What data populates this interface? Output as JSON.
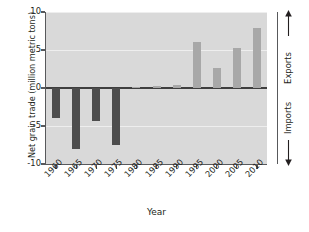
{
  "chart_data": {
    "type": "bar",
    "title": "",
    "subtitle": "",
    "xlabel": "Year",
    "ylabel": "Net grain trade (million metric tons)",
    "categories": [
      "1960",
      "1965",
      "1970",
      "1975",
      "1980",
      "1985",
      "1990",
      "1995",
      "2000",
      "2005",
      "2010"
    ],
    "values": [
      -4.0,
      -8.0,
      -4.4,
      -7.5,
      0.15,
      0.3,
      0.4,
      6.1,
      2.6,
      5.2,
      7.9
    ],
    "series": [
      {
        "name": "Net grain trade",
        "values": [
          -4.0,
          -8.0,
          -4.4,
          -7.5,
          0.15,
          0.3,
          0.4,
          6.1,
          2.6,
          5.2,
          7.9
        ]
      }
    ],
    "xlim": [
      1957.5,
      2012.5
    ],
    "ylim": [
      -10,
      10
    ],
    "ytick_values": [
      10,
      5,
      0,
      -5,
      -10
    ],
    "ytick_labels": [
      "10",
      "5",
      "0",
      "-5",
      "-10"
    ],
    "xtick_labels": [
      "1960",
      "1965",
      "1970",
      "1975",
      "1980",
      "1985",
      "1990",
      "1995",
      "2000",
      "2005",
      "2010"
    ],
    "grid": true,
    "grid_axis": "y",
    "legend": "none",
    "legend_position": "none",
    "annotations": [
      {
        "text": "Exports",
        "position": "right-upper",
        "arrow": "up"
      },
      {
        "text": "Imports",
        "position": "right-lower",
        "arrow": "down"
      }
    ],
    "colors": {
      "imports_bar": "#4d4d4d",
      "exports_bar": "#a8a8a8",
      "plot_background": "#d9d9d9",
      "gridline": "#eeeeee",
      "axis": "#58595b",
      "baseline": "#3f3f3f",
      "text": "#231f20",
      "figure_background": "#ffffff"
    }
  },
  "axes": {
    "right_direction_axis": {
      "upper_label": "Exports",
      "lower_label": "Imports"
    }
  }
}
